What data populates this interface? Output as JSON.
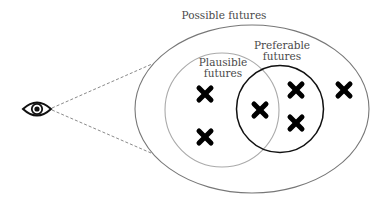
{
  "diagram": {
    "title": "Possible futures",
    "colors": {
      "background": "#ffffff",
      "outer_ellipse": "#777777",
      "plausible_circle": "#aaaaaa",
      "preferable_circle": "#111111",
      "sight_lines": "#8a8a8a",
      "marks": "#000000",
      "text": "#4a4a4a"
    },
    "observer": {
      "icon": "eye-icon",
      "x": 37,
      "y": 109
    },
    "sets": [
      {
        "id": "possible",
        "label_lines": [
          "Possible futures"
        ],
        "shape": "ellipse",
        "cx": 252,
        "cy": 109,
        "rx": 117,
        "ry": 84
      },
      {
        "id": "plausible",
        "label_lines": [
          "Plausible",
          "futures"
        ],
        "shape": "circle",
        "cx": 222,
        "cy": 110,
        "r": 57
      },
      {
        "id": "preferable",
        "label_lines": [
          "Preferable",
          "futures"
        ],
        "shape": "circle",
        "cx": 280,
        "cy": 109,
        "r": 43
      }
    ],
    "labels": {
      "possible": "Possible futures",
      "plausible_line1": "Plausible",
      "plausible_line2": "futures",
      "preferable_line1": "Preferable",
      "preferable_line2": "futures"
    },
    "marks": [
      {
        "x": 205,
        "y": 94,
        "region": "plausible"
      },
      {
        "x": 205,
        "y": 137,
        "region": "plausible"
      },
      {
        "x": 260,
        "y": 110,
        "region": "plausible-and-preferable"
      },
      {
        "x": 296,
        "y": 90,
        "region": "preferable"
      },
      {
        "x": 296,
        "y": 123,
        "region": "preferable"
      },
      {
        "x": 344,
        "y": 90,
        "region": "possible"
      }
    ]
  }
}
